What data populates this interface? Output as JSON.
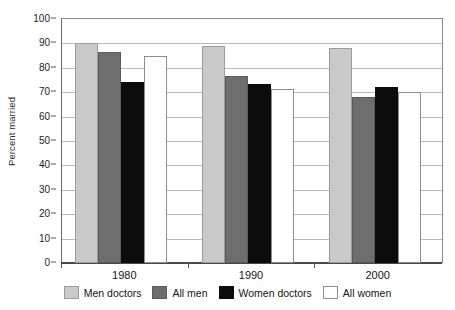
{
  "chart_data": {
    "type": "bar",
    "title": "",
    "xlabel": "",
    "ylabel": "Percent married",
    "categories": [
      "1980",
      "1990",
      "2000"
    ],
    "series": [
      {
        "name": "Men doctors",
        "color": "#c9c9c9",
        "values": [
          90.0,
          89.0,
          88.0
        ]
      },
      {
        "name": "All men",
        "color": "#6e6e6e",
        "values": [
          86.5,
          76.5,
          68.0
        ]
      },
      {
        "name": "Women doctors",
        "color": "#0c0c0c",
        "values": [
          74.0,
          73.5,
          72.0
        ]
      },
      {
        "name": "All women",
        "color": "#ffffff",
        "values": [
          85.0,
          71.5,
          70.0
        ]
      }
    ],
    "ylim": [
      0,
      100
    ],
    "ytick_values": [
      0,
      10,
      20,
      30,
      40,
      50,
      60,
      70,
      80,
      90,
      100
    ],
    "ytick_labels": [
      "0",
      "10",
      "20",
      "30",
      "40",
      "50",
      "60",
      "70",
      "80",
      "90",
      "100"
    ],
    "grid": "horizontal",
    "legend_position": "bottom"
  }
}
